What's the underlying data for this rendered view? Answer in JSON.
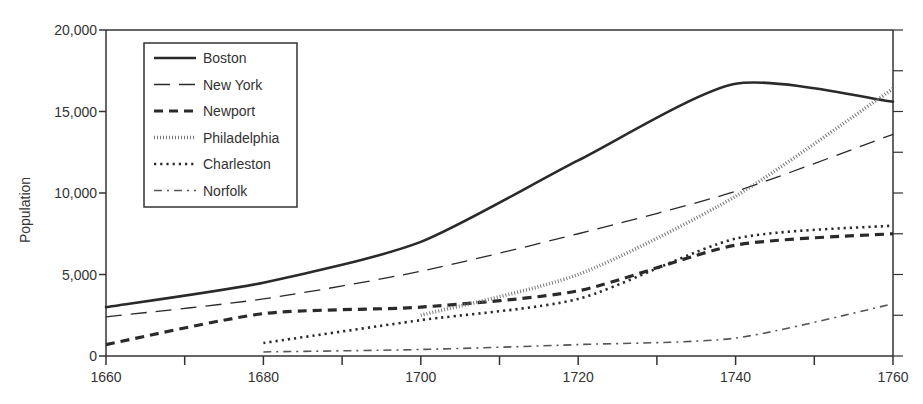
{
  "chart_data": {
    "type": "line",
    "title": "",
    "xlabel": "",
    "ylabel": "Population",
    "x": [
      1660,
      1680,
      1700,
      1720,
      1740,
      1760
    ],
    "xticks": [
      1660,
      1680,
      1700,
      1720,
      1740,
      1760
    ],
    "xtick_labels": [
      "1660",
      "1680",
      "1700",
      "1720",
      "1740",
      "1760"
    ],
    "yticks": [
      0,
      5000,
      10000,
      15000,
      20000
    ],
    "ytick_labels": [
      "0",
      "5,000",
      "10,000",
      "15,000",
      "20,000"
    ],
    "xlim": [
      1660,
      1760
    ],
    "ylim": [
      0,
      20000
    ],
    "grid": false,
    "legend_position": "upper left",
    "series": [
      {
        "name": "Boston",
        "style": "solid-thick",
        "x": [
          1660,
          1680,
          1700,
          1720,
          1740,
          1760
        ],
        "values": [
          3000,
          4500,
          7000,
          12000,
          16700,
          15600
        ]
      },
      {
        "name": "New York",
        "style": "long-dash",
        "x": [
          1660,
          1680,
          1700,
          1720,
          1740,
          1760
        ],
        "values": [
          2400,
          3500,
          5200,
          7500,
          10100,
          13600
        ]
      },
      {
        "name": "Newport",
        "style": "dash-thick",
        "x": [
          1660,
          1680,
          1700,
          1720,
          1740,
          1760
        ],
        "values": [
          700,
          2600,
          3000,
          4000,
          6800,
          7500
        ]
      },
      {
        "name": "Philadelphia",
        "style": "fine-dotted",
        "x": [
          1700,
          1720,
          1740,
          1760
        ],
        "values": [
          2500,
          5000,
          9800,
          16400
        ]
      },
      {
        "name": "Charleston",
        "style": "dotted",
        "x": [
          1680,
          1700,
          1720,
          1740,
          1760
        ],
        "values": [
          800,
          2200,
          3500,
          7200,
          8000
        ]
      },
      {
        "name": "Norfolk",
        "style": "dash-dot",
        "x": [
          1680,
          1700,
          1720,
          1740,
          1760
        ],
        "values": [
          250,
          400,
          700,
          1100,
          3200
        ]
      }
    ]
  },
  "legend": {
    "items": [
      "Boston",
      "New York",
      "Newport",
      "Philadelphia",
      "Charleston",
      "Norfolk"
    ]
  },
  "axes": {
    "ylabel": "Population",
    "x_ticks": [
      "1660",
      "1680",
      "1700",
      "1720",
      "1740",
      "1760"
    ],
    "y_ticks": [
      "0",
      "5,000",
      "10,000",
      "15,000",
      "20,000"
    ]
  },
  "colors": {
    "line": "#2a2a2a",
    "axis": "#333333",
    "text": "#333333"
  }
}
